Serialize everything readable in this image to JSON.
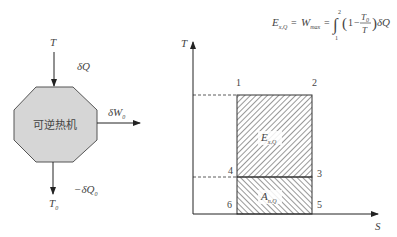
{
  "formula": {
    "lhs": "E",
    "lhs_sub": "x,Q",
    "eq1": "=",
    "mid": "W",
    "mid_sub": "max",
    "eq2": "=",
    "integral_upper": "2",
    "integral_lower": "1",
    "body_one": "1",
    "body_minus": "−",
    "frac_num": "T",
    "frac_num_sub": "0",
    "frac_den": "T",
    "tail": "δQ"
  },
  "engine": {
    "label": "可逆热机",
    "fill": "#d6d6d6",
    "top_temp": "T",
    "heat_in": "δQ",
    "work_out": "δW",
    "work_out_sub": "0",
    "heat_out": "−δQ",
    "heat_out_sub": "0",
    "bottom_temp": "T",
    "bottom_temp_sub": "0"
  },
  "ts_diagram": {
    "y_axis_label": "T",
    "x_axis_label": "S",
    "points": [
      "1",
      "2",
      "3",
      "4",
      "5",
      "6"
    ],
    "exergy_region": "E",
    "exergy_region_sub": "x,Q",
    "anergy_region": "A",
    "anergy_region_sub": "n,Q"
  }
}
